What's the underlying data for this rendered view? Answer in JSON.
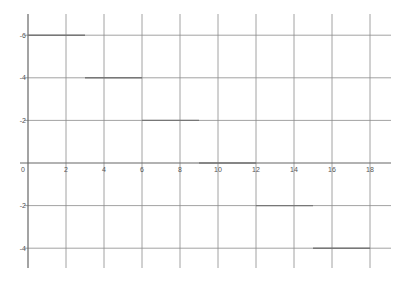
{
  "chart_data": {
    "type": "line",
    "title": "",
    "xlabel": "",
    "ylabel": "",
    "xlim": [
      0,
      19
    ],
    "ylim": [
      -5,
      7
    ],
    "grid": true,
    "legend": null,
    "x_ticks": [
      0,
      2,
      4,
      6,
      8,
      10,
      12,
      14,
      16,
      18
    ],
    "x_tick_labels": [
      "0",
      "2",
      "4",
      "6",
      "8",
      "10",
      "12",
      "14",
      "16",
      "18"
    ],
    "y_ticks": [
      6,
      4,
      2,
      -2,
      -4
    ],
    "y_tick_labels": [
      "-6",
      "-4",
      "-2",
      "-2",
      "-4"
    ],
    "series": [
      {
        "name": "step function",
        "segments": [
          {
            "x": [
              0,
              3
            ],
            "y": 6
          },
          {
            "x": [
              3,
              6
            ],
            "y": 4
          },
          {
            "x": [
              6,
              9
            ],
            "y": 2
          },
          {
            "x": [
              9,
              12
            ],
            "y": 0
          },
          {
            "x": [
              12,
              15
            ],
            "y": -2
          },
          {
            "x": [
              15,
              18
            ],
            "y": -4
          }
        ]
      }
    ]
  },
  "colors": {
    "grid": "#8a8a8a",
    "axis": "#666666",
    "series": "#777777",
    "label": "#555555"
  },
  "layout": {
    "origin_px": [
      28,
      163
    ],
    "x_unit_px": 19,
    "y_unit_px": 21.3,
    "plot_left_px": 28,
    "plot_right_px": 391,
    "plot_top_px": 14,
    "plot_bottom_px": 268
  }
}
